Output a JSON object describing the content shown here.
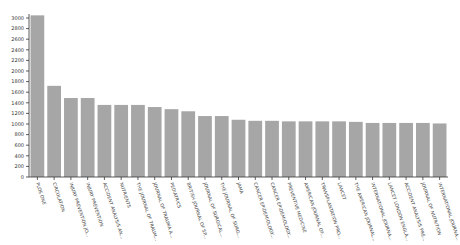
{
  "chart_data": {
    "type": "bar",
    "title": "",
    "xlabel": "",
    "ylabel": "",
    "ylim": [
      0,
      3000
    ],
    "yticks": [
      0,
      200,
      400,
      600,
      800,
      1000,
      1200,
      1400,
      1600,
      1800,
      2000,
      2200,
      2400,
      2600,
      2800,
      3000
    ],
    "grid": false,
    "legend": null,
    "bar_color": "#a6a6a6",
    "categories": [
      "PLOS ONE",
      "CIRCULATION",
      "INJURY PREVENTION JO...",
      "INJURY PREVENTION",
      "ACCIDENT ANALYSIS AN...",
      "NUTRIENTS",
      "THE JOURNAL OF TRAUM...",
      "JOURNAL OF TRAUMA A...",
      "PEDIATRICS",
      "BRITISH JOURNAL OF SP...",
      "JOURNAL OF SURGICAL...",
      "THE JOURNAL OF SURG...",
      "JAMA",
      "CANCER EPIDEMIOLOGY...",
      "CANCER EPIDEMIOLOGY...",
      "PREVENTIVE MEDICINE",
      "AMERICAN JOURNAL OF...",
      "TRANSPLANTATION PRO...",
      "LANCET",
      "THE AMERICAN JOURNAL...",
      "INTERNATIONAL JOURNA...",
      "LANCET LONDON ENGLA...",
      "ACCIDENT ANALYSIS PRE...",
      "JOURNAL OF NUTRITION",
      "INTERNATIONAL JOURNA..."
    ],
    "values": [
      3050,
      1720,
      1490,
      1490,
      1360,
      1360,
      1360,
      1320,
      1280,
      1240,
      1150,
      1150,
      1080,
      1060,
      1060,
      1050,
      1050,
      1050,
      1050,
      1040,
      1020,
      1020,
      1020,
      1020,
      1010
    ]
  }
}
